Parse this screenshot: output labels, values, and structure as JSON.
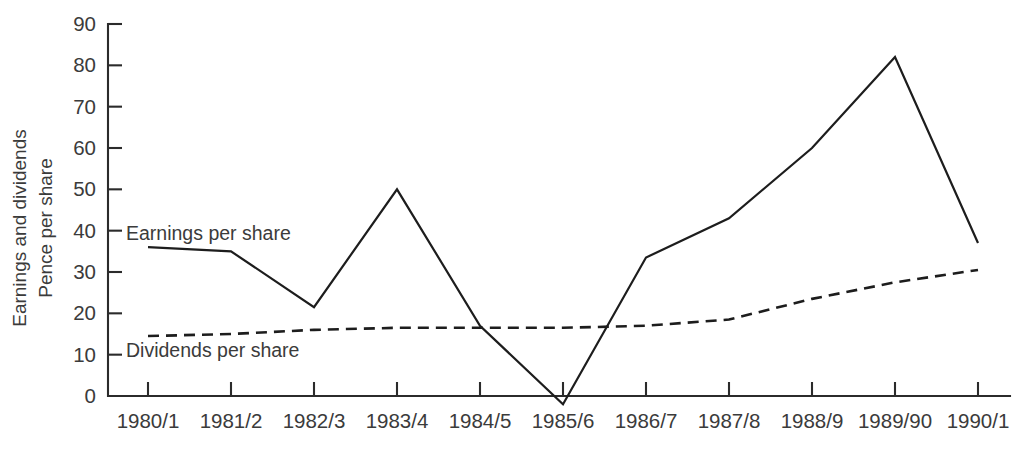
{
  "chart_data": {
    "type": "line",
    "title": "",
    "subtitle": "",
    "xlabel": "",
    "ylabel": "Earnings and dividends Pence per share",
    "ylabel_line1": "Earnings and dividends",
    "ylabel_line2": "Pence per share",
    "categories": [
      "1980/1",
      "1981/2",
      "1982/3",
      "1983/4",
      "1984/5",
      "1985/6",
      "1986/7",
      "1987/8",
      "1988/9",
      "1989/90",
      "1990/1"
    ],
    "ylim": [
      -3,
      90
    ],
    "yticks": [
      0,
      10,
      20,
      30,
      40,
      50,
      60,
      70,
      80,
      90
    ],
    "ytick_labels": [
      "0",
      "10",
      "20",
      "30",
      "40",
      "50",
      "60",
      "70",
      "80",
      "90"
    ],
    "grid": false,
    "legend_position": "inline-annotations",
    "series": [
      {
        "name": "Earnings per share",
        "style": "solid",
        "color": "#1d1d1d",
        "values": [
          36,
          35,
          21.5,
          50,
          17,
          -2,
          33.5,
          43,
          60,
          82,
          37
        ]
      },
      {
        "name": "Dividends per share",
        "style": "dashed",
        "color": "#1d1d1d",
        "values": [
          14.5,
          15,
          16,
          16.5,
          16.5,
          16.5,
          17,
          18.5,
          23.5,
          27.5,
          30.5
        ]
      }
    ],
    "annotations": [
      {
        "text": "Earnings per share",
        "x_category": "1980/1",
        "y_value": 40
      },
      {
        "text": "Dividends per share",
        "x_category": "1980/1",
        "y_value": 11
      }
    ]
  }
}
